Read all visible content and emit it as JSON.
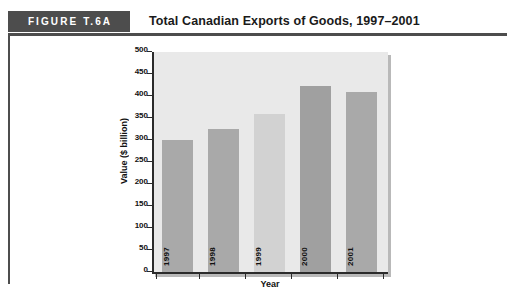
{
  "figure": {
    "badge_label": "FIGURE T.6A",
    "title": "Total Canadian Exports of Goods, 1997–2001",
    "badge_color": "#4d4d4d",
    "rule_color": "#4d4d4d"
  },
  "chart_data": {
    "type": "bar",
    "title": "Total Canadian Exports of Goods, 1997–2001",
    "categories": [
      "1997",
      "1998",
      "1999",
      "2000",
      "2001"
    ],
    "values": [
      300,
      325,
      360,
      422,
      410
    ],
    "xlabel": "Year",
    "ylabel": "Value ($ billion)",
    "ylim": [
      0,
      500
    ],
    "ytick_labels": [
      "500",
      "450",
      "400",
      "350",
      "300",
      "250",
      "200",
      "150",
      "100",
      "50",
      "0"
    ],
    "ytick_values": [
      500,
      450,
      400,
      350,
      300,
      250,
      200,
      150,
      100,
      50,
      0
    ],
    "ytick_step": 50,
    "grid": false,
    "legend": false,
    "bar_colors": [
      "#a9a9a9",
      "#a9a9a9",
      "#d2d2d2",
      "#a0a0a0",
      "#a9a9a9"
    ],
    "plot_background": "#e9e9e9",
    "axis_color": "#2b2b2b"
  }
}
